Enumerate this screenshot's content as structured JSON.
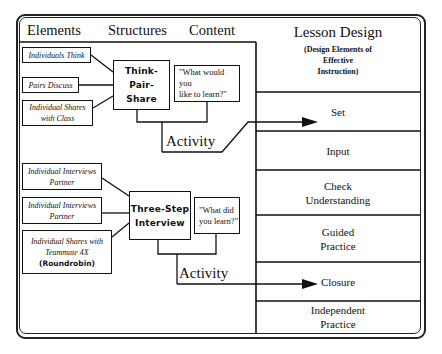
{
  "headers": {
    "elements": "Elements",
    "structures": "Structures",
    "content": "Content"
  },
  "lesson_design": {
    "title": "Lesson Design",
    "subtitle_line1": "(Design Elements of",
    "subtitle_line2": "Effective",
    "subtitle_line3": "Instruction)",
    "rows": [
      {
        "line1": "Set",
        "line2": ""
      },
      {
        "line1": "Input",
        "line2": ""
      },
      {
        "line1": "Check",
        "line2": "Understanding"
      },
      {
        "line1": "Guided",
        "line2": "Practice"
      },
      {
        "line1": "Closure",
        "line2": ""
      },
      {
        "line1": "Independent",
        "line2": "Practice"
      }
    ]
  },
  "group1": {
    "elements": [
      {
        "line1": "Individuals Think",
        "line2": ""
      },
      {
        "line1": "Pairs Discuss",
        "line2": ""
      },
      {
        "line1": "Individual Shares",
        "line2": "with Class"
      }
    ],
    "structure": {
      "line1": "Think-Pair-",
      "line2": "Share"
    },
    "content": {
      "line1": "\"What would you",
      "line2": "like to learn?\""
    },
    "activity": "Activity",
    "arrow_target": "Set"
  },
  "group2": {
    "elements": [
      {
        "line1": "Individual Interviews",
        "line2": "Partner",
        "line3": ""
      },
      {
        "line1": "Individual Interviews",
        "line2": "Partner",
        "line3": ""
      },
      {
        "line1": "Individual Shares with",
        "line2": "Teammate 4X",
        "line3": "(Roundrobin)"
      }
    ],
    "structure": {
      "line1": "Three-Step",
      "line2": "Interview"
    },
    "content": {
      "line1": "\"What did",
      "line2": "you learn?\""
    },
    "activity": "Activity",
    "arrow_target": "Closure"
  }
}
